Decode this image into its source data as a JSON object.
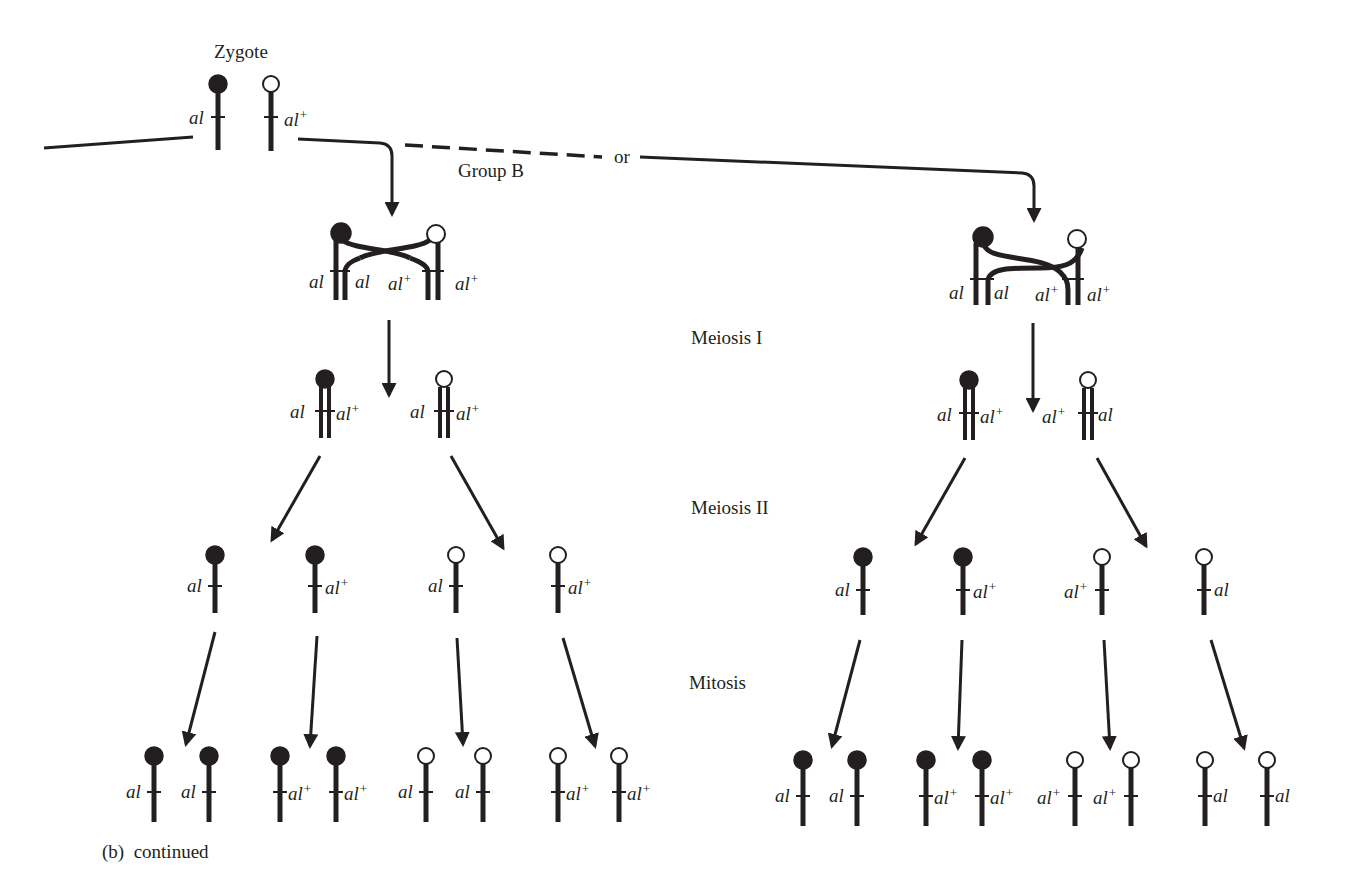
{
  "figure": {
    "caption": "(b)  continued",
    "zygote_label": "Zygote",
    "group_label": "Group B",
    "or_label": "or",
    "stages": [
      "Meiosis I",
      "Meiosis II",
      "Mitosis"
    ],
    "colors": {
      "ink": "#231f20",
      "background": "#ffffff",
      "filled_centromere": "#231f20",
      "open_centromere": "#ffffff"
    }
  },
  "zygote": {
    "chromosomes": [
      {
        "centromere": "filled",
        "allele": "al",
        "side": "left"
      },
      {
        "centromere": "open",
        "allele": "al+",
        "side": "right"
      }
    ]
  },
  "left_branch": {
    "tetrad_alleles": [
      "al",
      "al",
      "al+",
      "al+"
    ],
    "meiosis_i_products": [
      {
        "centromere": "filled",
        "left": "al",
        "right": "al+"
      },
      {
        "centromere": "open",
        "left": "al",
        "right": "al+"
      }
    ],
    "meiosis_ii_products": [
      {
        "centromere": "filled",
        "allele": "al",
        "side": "left"
      },
      {
        "centromere": "filled",
        "allele": "al+",
        "side": "right"
      },
      {
        "centromere": "open",
        "allele": "al",
        "side": "left"
      },
      {
        "centromere": "open",
        "allele": "al+",
        "side": "right"
      }
    ],
    "mitosis_products": [
      {
        "centromere": "filled",
        "allele": "al",
        "side": "left"
      },
      {
        "centromere": "filled",
        "allele": "al",
        "side": "left"
      },
      {
        "centromere": "filled",
        "allele": "al+",
        "side": "right"
      },
      {
        "centromere": "filled",
        "allele": "al+",
        "side": "right"
      },
      {
        "centromere": "open",
        "allele": "al",
        "side": "left"
      },
      {
        "centromere": "open",
        "allele": "al",
        "side": "left"
      },
      {
        "centromere": "open",
        "allele": "al+",
        "side": "right"
      },
      {
        "centromere": "open",
        "allele": "al+",
        "side": "right"
      }
    ]
  },
  "right_branch": {
    "tetrad_alleles": [
      "al",
      "al",
      "al+",
      "al+"
    ],
    "meiosis_i_products": [
      {
        "centromere": "filled",
        "left": "al",
        "right": "al+"
      },
      {
        "centromere": "open",
        "left": "al+",
        "right": "al"
      }
    ],
    "meiosis_ii_products": [
      {
        "centromere": "filled",
        "allele": "al",
        "side": "left"
      },
      {
        "centromere": "filled",
        "allele": "al+",
        "side": "right"
      },
      {
        "centromere": "open",
        "allele": "al+",
        "side": "left"
      },
      {
        "centromere": "open",
        "allele": "al",
        "side": "right"
      }
    ],
    "mitosis_products": [
      {
        "centromere": "filled",
        "allele": "al",
        "side": "left"
      },
      {
        "centromere": "filled",
        "allele": "al",
        "side": "left"
      },
      {
        "centromere": "filled",
        "allele": "al+",
        "side": "right"
      },
      {
        "centromere": "filled",
        "allele": "al+",
        "side": "right"
      },
      {
        "centromere": "open",
        "allele": "al+",
        "side": "left"
      },
      {
        "centromere": "open",
        "allele": "al+",
        "side": "left"
      },
      {
        "centromere": "open",
        "allele": "al",
        "side": "right"
      },
      {
        "centromere": "open",
        "allele": "al",
        "side": "right"
      }
    ]
  }
}
